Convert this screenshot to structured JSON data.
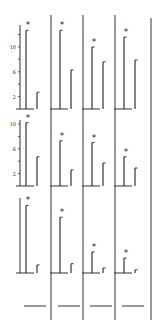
{
  "chart_data": {
    "type": "bar",
    "title": "",
    "xlabel": "",
    "ylabel": "",
    "layout": {
      "rows": 3,
      "cols": 4,
      "grid": false,
      "legend": "none"
    },
    "ylim": [
      0,
      13
    ],
    "y_tick_labels": [
      "2",
      "6",
      "10"
    ],
    "annotation_symbol": "*",
    "panels": [
      {
        "row": 1,
        "col": 1,
        "values": [
          12.7,
          2.7
        ],
        "significant": [
          true,
          false
        ]
      },
      {
        "row": 1,
        "col": 2,
        "values": [
          12.7,
          6.3
        ],
        "significant": [
          true,
          false
        ]
      },
      {
        "row": 1,
        "col": 3,
        "values": [
          10.0,
          7.6
        ],
        "significant": [
          true,
          false
        ]
      },
      {
        "row": 1,
        "col": 4,
        "values": [
          11.6,
          7.9
        ],
        "significant": [
          true,
          false
        ]
      },
      {
        "row": 2,
        "col": 1,
        "values": [
          10.2,
          4.7
        ],
        "significant": [
          true,
          false
        ]
      },
      {
        "row": 2,
        "col": 2,
        "values": [
          7.3,
          2.6
        ],
        "significant": [
          true,
          false
        ]
      },
      {
        "row": 2,
        "col": 3,
        "values": [
          7.0,
          3.7
        ],
        "significant": [
          true,
          false
        ]
      },
      {
        "row": 2,
        "col": 4,
        "values": [
          4.7,
          2.9
        ],
        "significant": [
          true,
          false
        ]
      },
      {
        "row": 3,
        "col": 1,
        "values": [
          10.9,
          1.3
        ],
        "significant": [
          true,
          false
        ]
      },
      {
        "row": 3,
        "col": 2,
        "values": [
          9.0,
          1.5
        ],
        "significant": [
          true,
          false
        ]
      },
      {
        "row": 3,
        "col": 3,
        "values": [
          3.4,
          0.8
        ],
        "significant": [
          true,
          false
        ]
      },
      {
        "row": 3,
        "col": 4,
        "values": [
          2.4,
          0.5
        ],
        "significant": [
          true,
          false
        ]
      }
    ]
  }
}
